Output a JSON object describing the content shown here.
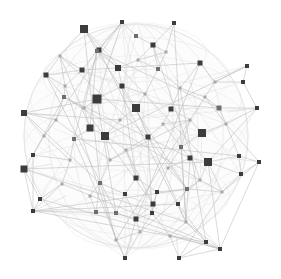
{
  "canvas": {
    "width": 281,
    "height": 279,
    "background_color": "#ffffff",
    "title": "spherical network graph"
  },
  "chart_data": {
    "type": "scatter",
    "title": "",
    "subtitle": "",
    "xlabel": "",
    "ylabel": "",
    "grid": false,
    "legend": null,
    "annotations": [],
    "xlim": [
      0,
      281
    ],
    "ylim": [
      0,
      279
    ],
    "sphere": {
      "cx": 136,
      "cy": 136,
      "r": 112,
      "rim_color": "#d8d8d8",
      "fill_color": "#fcfcfc"
    },
    "style": {
      "node_shape": "square",
      "node_color_dark": "#3c3c3c",
      "node_color_mid": "#6e6e6e",
      "node_color_light": "#a8a8a8",
      "edge_color": "#b9b9b9",
      "edge_color_faint": "#dcdcdc",
      "edge_width": 0.55,
      "node_count": 118,
      "edge_count": 243
    },
    "nodes": [
      {
        "id": 0,
        "x": 84,
        "y": 29,
        "size": 8,
        "shade": "dark"
      },
      {
        "id": 1,
        "x": 122,
        "y": 22,
        "size": 4,
        "shade": "dark"
      },
      {
        "id": 2,
        "x": 174,
        "y": 23,
        "size": 4,
        "shade": "dark"
      },
      {
        "id": 3,
        "x": 136,
        "y": 36,
        "size": 4,
        "shade": "mid"
      },
      {
        "id": 4,
        "x": 99,
        "y": 50,
        "size": 5,
        "shade": "dark"
      },
      {
        "id": 5,
        "x": 153,
        "y": 45,
        "size": 5,
        "shade": "dark"
      },
      {
        "id": 6,
        "x": 46,
        "y": 75,
        "size": 5,
        "shade": "dark"
      },
      {
        "id": 7,
        "x": 82,
        "y": 70,
        "size": 5,
        "shade": "dark"
      },
      {
        "id": 8,
        "x": 118,
        "y": 68,
        "size": 6,
        "shade": "dark"
      },
      {
        "id": 9,
        "x": 97,
        "y": 51,
        "size": 4,
        "shade": "mid"
      },
      {
        "id": 10,
        "x": 158,
        "y": 69,
        "size": 4,
        "shade": "mid"
      },
      {
        "id": 11,
        "x": 200,
        "y": 63,
        "size": 5,
        "shade": "dark"
      },
      {
        "id": 12,
        "x": 247,
        "y": 66,
        "size": 4,
        "shade": "dark"
      },
      {
        "id": 13,
        "x": 243,
        "y": 82,
        "size": 4,
        "shade": "dark"
      },
      {
        "id": 14,
        "x": 122,
        "y": 86,
        "size": 5,
        "shade": "dark"
      },
      {
        "id": 15,
        "x": 64,
        "y": 97,
        "size": 4,
        "shade": "mid"
      },
      {
        "id": 16,
        "x": 97,
        "y": 99,
        "size": 9,
        "shade": "dark"
      },
      {
        "id": 17,
        "x": 136,
        "y": 108,
        "size": 8,
        "shade": "dark"
      },
      {
        "id": 18,
        "x": 171,
        "y": 109,
        "size": 5,
        "shade": "dark"
      },
      {
        "id": 19,
        "x": 219,
        "y": 108,
        "size": 5,
        "shade": "mid"
      },
      {
        "id": 20,
        "x": 257,
        "y": 108,
        "size": 4,
        "shade": "dark"
      },
      {
        "id": 21,
        "x": 24,
        "y": 113,
        "size": 6,
        "shade": "dark"
      },
      {
        "id": 22,
        "x": 90,
        "y": 128,
        "size": 7,
        "shade": "dark"
      },
      {
        "id": 23,
        "x": 105,
        "y": 136,
        "size": 8,
        "shade": "dark"
      },
      {
        "id": 24,
        "x": 148,
        "y": 137,
        "size": 5,
        "shade": "dark"
      },
      {
        "id": 25,
        "x": 202,
        "y": 133,
        "size": 8,
        "shade": "dark"
      },
      {
        "id": 26,
        "x": 74,
        "y": 139,
        "size": 4,
        "shade": "mid"
      },
      {
        "id": 27,
        "x": 181,
        "y": 147,
        "size": 4,
        "shade": "mid"
      },
      {
        "id": 28,
        "x": 33,
        "y": 155,
        "size": 4,
        "shade": "dark"
      },
      {
        "id": 29,
        "x": 190,
        "y": 158,
        "size": 5,
        "shade": "dark"
      },
      {
        "id": 30,
        "x": 208,
        "y": 162,
        "size": 8,
        "shade": "dark"
      },
      {
        "id": 31,
        "x": 239,
        "y": 156,
        "size": 4,
        "shade": "dark"
      },
      {
        "id": 32,
        "x": 259,
        "y": 162,
        "size": 4,
        "shade": "dark"
      },
      {
        "id": 33,
        "x": 24,
        "y": 169,
        "size": 7,
        "shade": "dark"
      },
      {
        "id": 34,
        "x": 241,
        "y": 174,
        "size": 4,
        "shade": "dark"
      },
      {
        "id": 35,
        "x": 136,
        "y": 178,
        "size": 5,
        "shade": "dark"
      },
      {
        "id": 36,
        "x": 100,
        "y": 183,
        "size": 4,
        "shade": "mid"
      },
      {
        "id": 37,
        "x": 187,
        "y": 189,
        "size": 4,
        "shade": "mid"
      },
      {
        "id": 38,
        "x": 40,
        "y": 199,
        "size": 4,
        "shade": "dark"
      },
      {
        "id": 39,
        "x": 125,
        "y": 194,
        "size": 4,
        "shade": "dark"
      },
      {
        "id": 40,
        "x": 157,
        "y": 192,
        "size": 4,
        "shade": "dark"
      },
      {
        "id": 41,
        "x": 33,
        "y": 211,
        "size": 4,
        "shade": "dark"
      },
      {
        "id": 42,
        "x": 153,
        "y": 204,
        "size": 5,
        "shade": "dark"
      },
      {
        "id": 43,
        "x": 178,
        "y": 204,
        "size": 4,
        "shade": "dark"
      },
      {
        "id": 44,
        "x": 152,
        "y": 213,
        "size": 4,
        "shade": "dark"
      },
      {
        "id": 45,
        "x": 96,
        "y": 212,
        "size": 4,
        "shade": "mid"
      },
      {
        "id": 46,
        "x": 116,
        "y": 213,
        "size": 4,
        "shade": "mid"
      },
      {
        "id": 47,
        "x": 136,
        "y": 219,
        "size": 5,
        "shade": "dark"
      },
      {
        "id": 48,
        "x": 206,
        "y": 242,
        "size": 4,
        "shade": "dark"
      },
      {
        "id": 49,
        "x": 220,
        "y": 249,
        "size": 4,
        "shade": "dark"
      },
      {
        "id": 50,
        "x": 125,
        "y": 258,
        "size": 4,
        "shade": "dark"
      },
      {
        "id": 51,
        "x": 179,
        "y": 258,
        "size": 4,
        "shade": "dark"
      },
      {
        "id": 52,
        "x": 65,
        "y": 86,
        "size": 3,
        "shade": "light"
      },
      {
        "id": 53,
        "x": 138,
        "y": 60,
        "size": 3,
        "shade": "light"
      },
      {
        "id": 54,
        "x": 180,
        "y": 88,
        "size": 3,
        "shade": "light"
      },
      {
        "id": 55,
        "x": 215,
        "y": 82,
        "size": 3,
        "shade": "light"
      },
      {
        "id": 56,
        "x": 56,
        "y": 120,
        "size": 3,
        "shade": "light"
      },
      {
        "id": 57,
        "x": 120,
        "y": 120,
        "size": 3,
        "shade": "light"
      },
      {
        "id": 58,
        "x": 163,
        "y": 124,
        "size": 3,
        "shade": "light"
      },
      {
        "id": 59,
        "x": 226,
        "y": 124,
        "size": 3,
        "shade": "light"
      },
      {
        "id": 60,
        "x": 70,
        "y": 160,
        "size": 3,
        "shade": "light"
      },
      {
        "id": 61,
        "x": 110,
        "y": 160,
        "size": 3,
        "shade": "light"
      },
      {
        "id": 62,
        "x": 168,
        "y": 168,
        "size": 3,
        "shade": "light"
      },
      {
        "id": 63,
        "x": 222,
        "y": 192,
        "size": 3,
        "shade": "light"
      },
      {
        "id": 64,
        "x": 90,
        "y": 196,
        "size": 3,
        "shade": "light"
      },
      {
        "id": 65,
        "x": 140,
        "y": 232,
        "size": 3,
        "shade": "light"
      },
      {
        "id": 66,
        "x": 186,
        "y": 222,
        "size": 3,
        "shade": "light"
      },
      {
        "id": 67,
        "x": 60,
        "y": 56,
        "size": 3,
        "shade": "light"
      },
      {
        "id": 68,
        "x": 166,
        "y": 52,
        "size": 3,
        "shade": "light"
      },
      {
        "id": 69,
        "x": 205,
        "y": 97,
        "size": 3,
        "shade": "light"
      },
      {
        "id": 70,
        "x": 44,
        "y": 136,
        "size": 3,
        "shade": "light"
      },
      {
        "id": 71,
        "x": 84,
        "y": 108,
        "size": 3,
        "shade": "light"
      },
      {
        "id": 72,
        "x": 145,
        "y": 94,
        "size": 3,
        "shade": "light"
      },
      {
        "id": 73,
        "x": 190,
        "y": 120,
        "size": 3,
        "shade": "light"
      },
      {
        "id": 74,
        "x": 126,
        "y": 150,
        "size": 3,
        "shade": "light"
      },
      {
        "id": 75,
        "x": 200,
        "y": 180,
        "size": 3,
        "shade": "light"
      },
      {
        "id": 76,
        "x": 62,
        "y": 184,
        "size": 3,
        "shade": "light"
      },
      {
        "id": 77,
        "x": 116,
        "y": 240,
        "size": 3,
        "shade": "light"
      },
      {
        "id": 78,
        "x": 170,
        "y": 236,
        "size": 3,
        "shade": "light"
      }
    ],
    "satellites": [
      {
        "id": 0,
        "x": 84,
        "y": 29,
        "anchor_x": 110,
        "anchor_y": 52
      },
      {
        "id": 12,
        "x": 247,
        "y": 66,
        "anchor_x": 212,
        "anchor_y": 80
      },
      {
        "id": 21,
        "x": 24,
        "y": 113,
        "anchor_x": 52,
        "anchor_y": 116
      },
      {
        "id": 33,
        "x": 24,
        "y": 169,
        "anchor_x": 52,
        "anchor_y": 164
      },
      {
        "id": 41,
        "x": 33,
        "y": 211,
        "anchor_x": 66,
        "anchor_y": 196
      },
      {
        "id": 20,
        "x": 257,
        "y": 108,
        "anchor_x": 228,
        "anchor_y": 112
      },
      {
        "id": 32,
        "x": 259,
        "y": 162,
        "anchor_x": 230,
        "anchor_y": 158
      },
      {
        "id": 49,
        "x": 220,
        "y": 249,
        "anchor_x": 200,
        "anchor_y": 226
      },
      {
        "id": 50,
        "x": 125,
        "y": 258,
        "anchor_x": 132,
        "anchor_y": 238
      },
      {
        "id": 51,
        "x": 179,
        "y": 258,
        "anchor_x": 176,
        "anchor_y": 236
      }
    ]
  }
}
